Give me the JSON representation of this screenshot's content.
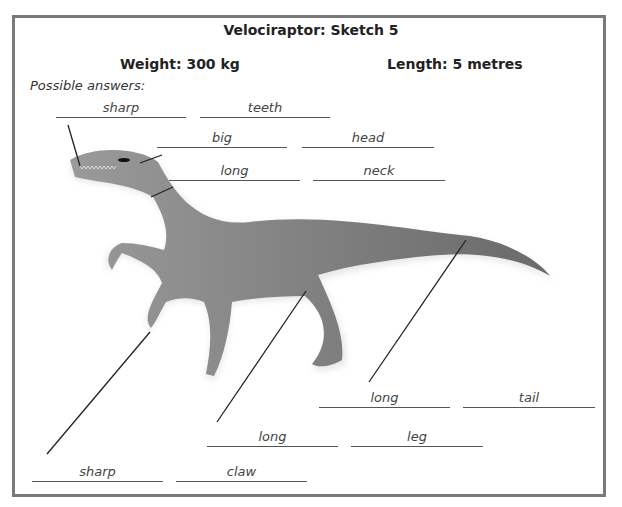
{
  "title": "Velociraptor: Sketch 5",
  "weight": "Weight: 300 kg",
  "length": "Length: 5 metres",
  "possible_answers_label": "Possible answers:",
  "answers": [
    {
      "text": "sharp",
      "x": 56,
      "y": 98,
      "w": 130
    },
    {
      "text": "teeth",
      "x": 200,
      "y": 98,
      "w": 130
    },
    {
      "text": "big",
      "x": 157,
      "y": 128,
      "w": 130
    },
    {
      "text": "head",
      "x": 302,
      "y": 128,
      "w": 132
    },
    {
      "text": "long",
      "x": 169,
      "y": 161,
      "w": 131
    },
    {
      "text": "neck",
      "x": 313,
      "y": 161,
      "w": 132
    },
    {
      "text": "long",
      "x": 319,
      "y": 388,
      "w": 131
    },
    {
      "text": "tail",
      "x": 463,
      "y": 388,
      "w": 132
    },
    {
      "text": "long",
      "x": 207,
      "y": 427,
      "w": 131
    },
    {
      "text": "leg",
      "x": 351,
      "y": 427,
      "w": 132
    },
    {
      "text": "sharp",
      "x": 32,
      "y": 462,
      "w": 131
    },
    {
      "text": "claw",
      "x": 176,
      "y": 462,
      "w": 131
    }
  ]
}
